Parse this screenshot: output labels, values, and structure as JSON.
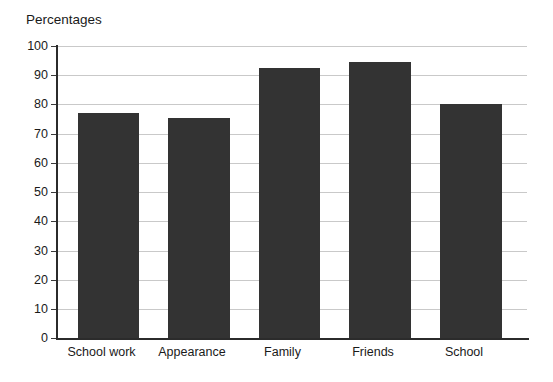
{
  "chart_data": {
    "type": "bar",
    "title": "Percentages",
    "xlabel": "",
    "ylabel": "",
    "categories": [
      "School work",
      "Appearance",
      "Family",
      "Friends",
      "School"
    ],
    "values": [
      77,
      75.5,
      92.5,
      94.5,
      80
    ],
    "ylim": [
      0,
      100
    ],
    "yticks": [
      0,
      10,
      20,
      30,
      40,
      50,
      60,
      70,
      80,
      90,
      100
    ],
    "ytick_labels": [
      "0",
      "10",
      "20",
      "30",
      "40",
      "50",
      "60",
      "70",
      "80",
      "90",
      "100"
    ],
    "grid": true,
    "legend": false,
    "series": [
      {
        "name": "Percentages",
        "values": [
          77,
          75.5,
          92.5,
          94.5,
          80
        ]
      }
    ],
    "colors": {
      "bar_fill": "#333333",
      "gridline": "#c9c9c9",
      "axis": "#2b2b2b",
      "text": "#1a1a1a",
      "background": "#ffffff"
    }
  }
}
